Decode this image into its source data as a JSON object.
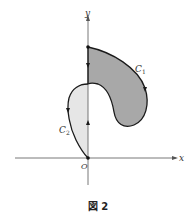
{
  "figure": {
    "caption": "図 2",
    "axes": {
      "x_label": "x",
      "y_label": "y",
      "origin_label": "O"
    },
    "curves": [
      {
        "name": "C1",
        "label_main": "C",
        "label_sub": "1",
        "fill": "#a8a8a8",
        "orientation": "clockwise"
      },
      {
        "name": "C2",
        "label_main": "C",
        "label_sub": "2",
        "fill": "#e6e6e6",
        "orientation": "counterclockwise"
      }
    ],
    "colors": {
      "stroke": "#1a1a1a",
      "axis": "#555555",
      "c1_fill": "#a8a8a8",
      "c2_fill": "#e6e6e6"
    }
  }
}
